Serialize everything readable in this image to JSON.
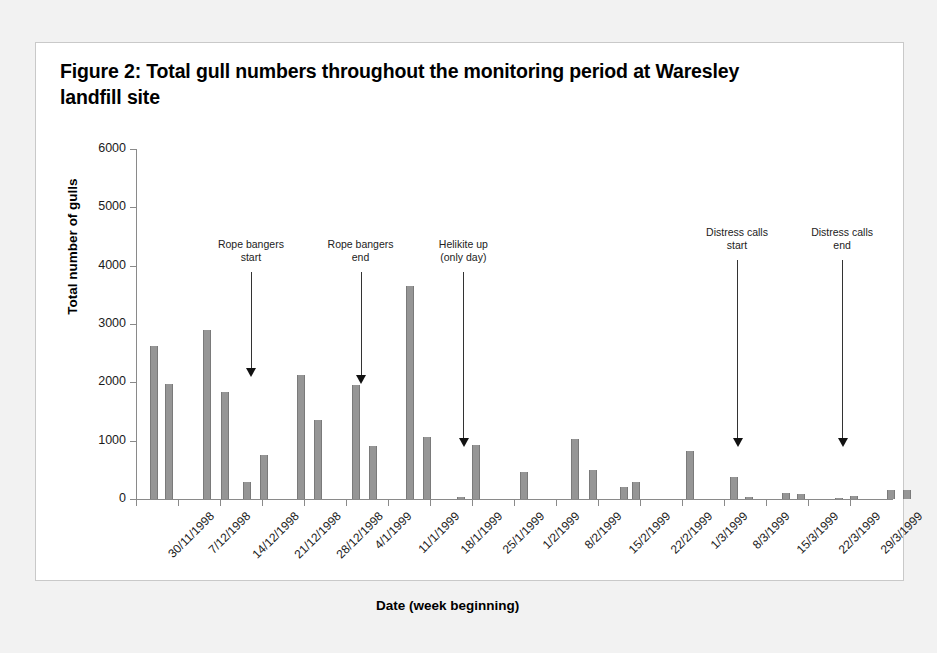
{
  "figure": {
    "title": "Figure 2: Total gull numbers throughout the monitoring period at Waresley landfill site"
  },
  "chart_data": {
    "type": "bar",
    "title": "Figure 2: Total gull numbers throughout the monitoring period at Waresley landfill site",
    "xlabel": "Date (week beginning)",
    "ylabel": "Total number of gulls",
    "ylim": [
      0,
      6000
    ],
    "yticks": [
      0,
      1000,
      2000,
      3000,
      4000,
      5000,
      6000
    ],
    "ytick_labels": [
      "0",
      "1000",
      "2000",
      "3000",
      "4000",
      "5000",
      "6000"
    ],
    "grid": false,
    "legend": "none",
    "bar_color": "#969696",
    "categories": [
      "30/11/1998",
      "7/12/1998",
      "14/12/1998",
      "21/12/1998",
      "28/12/1998",
      "4/1/1999",
      "11/1/1999",
      "18/1/1999",
      "25/1/1999",
      "1/2/1999",
      "8/2/1999",
      "15/2/1999",
      "22/2/1999",
      "1/3/1999",
      "8/3/1999",
      "15/3/1999",
      "22/3/1999",
      "29/3/1999"
    ],
    "note": "Several daily counts are plotted within each week; values are read off the 0-6000 axis.",
    "bars": [
      {
        "week": "30/11/1998",
        "x_frac": 0.018,
        "value": 2630
      },
      {
        "week": "30/11/1998",
        "x_frac": 0.039,
        "value": 1980
      },
      {
        "week": "7/12/1998",
        "x_frac": 0.089,
        "value": 2900
      },
      {
        "week": "7/12/1998",
        "x_frac": 0.112,
        "value": 1840
      },
      {
        "week": "14/12/1998",
        "x_frac": 0.142,
        "value": 290
      },
      {
        "week": "14/12/1998",
        "x_frac": 0.164,
        "value": 750
      },
      {
        "week": "21/12/1998",
        "x_frac": 0.213,
        "value": 2120
      },
      {
        "week": "21/12/1998",
        "x_frac": 0.236,
        "value": 1350
      },
      {
        "week": "28/12/1998",
        "x_frac": 0.286,
        "value": 1960
      },
      {
        "week": "28/12/1998",
        "x_frac": 0.308,
        "value": 910
      },
      {
        "week": "4/1/1999",
        "x_frac": 0.357,
        "value": 3650
      },
      {
        "week": "4/1/1999",
        "x_frac": 0.38,
        "value": 1070
      },
      {
        "week": "11/1/1999",
        "x_frac": 0.424,
        "value": 40
      },
      {
        "week": "11/1/1999",
        "x_frac": 0.444,
        "value": 930
      },
      {
        "week": "18/1/1999",
        "x_frac": 0.508,
        "value": 460
      },
      {
        "week": "25/1/1999",
        "x_frac": 0.576,
        "value": 1030
      },
      {
        "week": "25/1/1999",
        "x_frac": 0.599,
        "value": 500
      },
      {
        "week": "1/2/1999",
        "x_frac": 0.64,
        "value": 200
      },
      {
        "week": "1/2/1999",
        "x_frac": 0.656,
        "value": 290
      },
      {
        "week": "8/2/1999",
        "x_frac": 0.728,
        "value": 820
      },
      {
        "week": "15/2/1999",
        "x_frac": 0.786,
        "value": 380
      },
      {
        "week": "15/2/1999",
        "x_frac": 0.806,
        "value": 40
      },
      {
        "week": "22/2/1999",
        "x_frac": 0.854,
        "value": 100
      },
      {
        "week": "22/2/1999",
        "x_frac": 0.874,
        "value": 80
      },
      {
        "week": "1/3/1999",
        "x_frac": 0.924,
        "value": 15
      },
      {
        "week": "1/3/1999",
        "x_frac": 0.944,
        "value": 50
      },
      {
        "week": "8/3/1999",
        "x_frac": 0.994,
        "value": 150
      },
      {
        "week": "8/3/1999",
        "x_frac": 1.014,
        "value": 160
      }
    ],
    "annotations": [
      {
        "label": "Rope bangers\nstart",
        "at_week": "14/12/1998",
        "x_frac": 0.152,
        "arrow_from_value": 3900,
        "arrow_to_value": 2100
      },
      {
        "label": "Rope bangers\nend",
        "at_week": "28/12/1998",
        "x_frac": 0.297,
        "arrow_from_value": 3900,
        "arrow_to_value": 1970
      },
      {
        "label": "Helikite up\n(only day)",
        "at_week": "11/1/1999",
        "x_frac": 0.433,
        "arrow_from_value": 3900,
        "arrow_to_value": 900
      },
      {
        "label": "Distress calls\nstart",
        "at_week": "15/2/1999",
        "x_frac": 0.795,
        "arrow_from_value": 4100,
        "arrow_to_value": 900
      },
      {
        "label": "Distress calls\nend",
        "at_week": "1/3/1999",
        "x_frac": 0.934,
        "arrow_from_value": 4100,
        "arrow_to_value": 900
      }
    ]
  }
}
